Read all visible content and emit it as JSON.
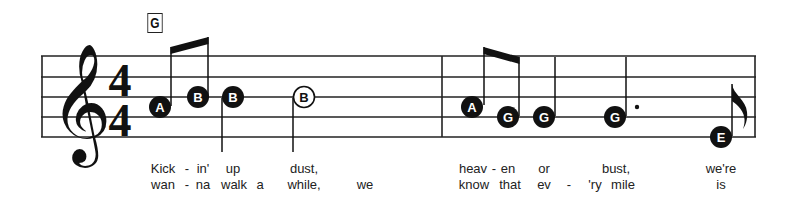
{
  "chord": {
    "label": "G"
  },
  "time_signature": {
    "top": "4",
    "bottom": "4"
  },
  "clef": "treble",
  "colors": {
    "ink": "#111111",
    "staff": "#222222",
    "background": "#ffffff"
  },
  "measures": [
    {
      "notes": [
        {
          "name": "A",
          "x": 160,
          "y": 107,
          "filled": true,
          "stem": "up",
          "duration": "eighth",
          "beam_group": 1
        },
        {
          "name": "B",
          "x": 198,
          "y": 97,
          "filled": true,
          "stem": "up",
          "duration": "eighth",
          "beam_group": 1
        },
        {
          "name": "B",
          "x": 233,
          "y": 97,
          "filled": true,
          "stem": "down",
          "duration": "quarter"
        },
        {
          "name": "B",
          "x": 304,
          "y": 97,
          "filled": false,
          "stem": "down",
          "duration": "half"
        }
      ]
    },
    {
      "notes": [
        {
          "name": "A",
          "x": 471,
          "y": 107,
          "filled": true,
          "stem": "up",
          "duration": "eighth",
          "beam_group": 2
        },
        {
          "name": "G",
          "x": 508,
          "y": 117,
          "filled": true,
          "stem": "up",
          "duration": "eighth",
          "beam_group": 2
        },
        {
          "name": "G",
          "x": 543,
          "y": 117,
          "filled": true,
          "stem": "up",
          "duration": "quarter"
        },
        {
          "name": "G",
          "x": 614,
          "y": 117,
          "filled": true,
          "stem": "up",
          "duration": "dotted-quarter"
        },
        {
          "name": "E",
          "x": 720,
          "y": 137,
          "filled": true,
          "stem": "up",
          "duration": "eighth-flag"
        }
      ]
    }
  ],
  "lyrics": {
    "verse1": [
      {
        "text": "Kick",
        "x": 163
      },
      {
        "text": "-",
        "x": 187
      },
      {
        "text": "in'",
        "x": 203
      },
      {
        "text": "up",
        "x": 233
      },
      {
        "text": "dust,",
        "x": 304
      },
      {
        "text": "heav",
        "x": 473
      },
      {
        "text": "-",
        "x": 494
      },
      {
        "text": "en",
        "x": 508
      },
      {
        "text": "or",
        "x": 544
      },
      {
        "text": "bust,",
        "x": 616
      },
      {
        "text": "we're",
        "x": 721
      }
    ],
    "verse2": [
      {
        "text": "wan",
        "x": 163
      },
      {
        "text": "-",
        "x": 187
      },
      {
        "text": "na",
        "x": 203
      },
      {
        "text": "walk",
        "x": 234
      },
      {
        "text": "a",
        "x": 260
      },
      {
        "text": "while,",
        "x": 304
      },
      {
        "text": "we",
        "x": 365
      },
      {
        "text": "know",
        "x": 474
      },
      {
        "text": "that",
        "x": 510
      },
      {
        "text": "ev",
        "x": 544
      },
      {
        "text": "-",
        "x": 569
      },
      {
        "text": "'ry",
        "x": 595
      },
      {
        "text": "mile",
        "x": 623
      },
      {
        "text": "is",
        "x": 721
      }
    ]
  }
}
